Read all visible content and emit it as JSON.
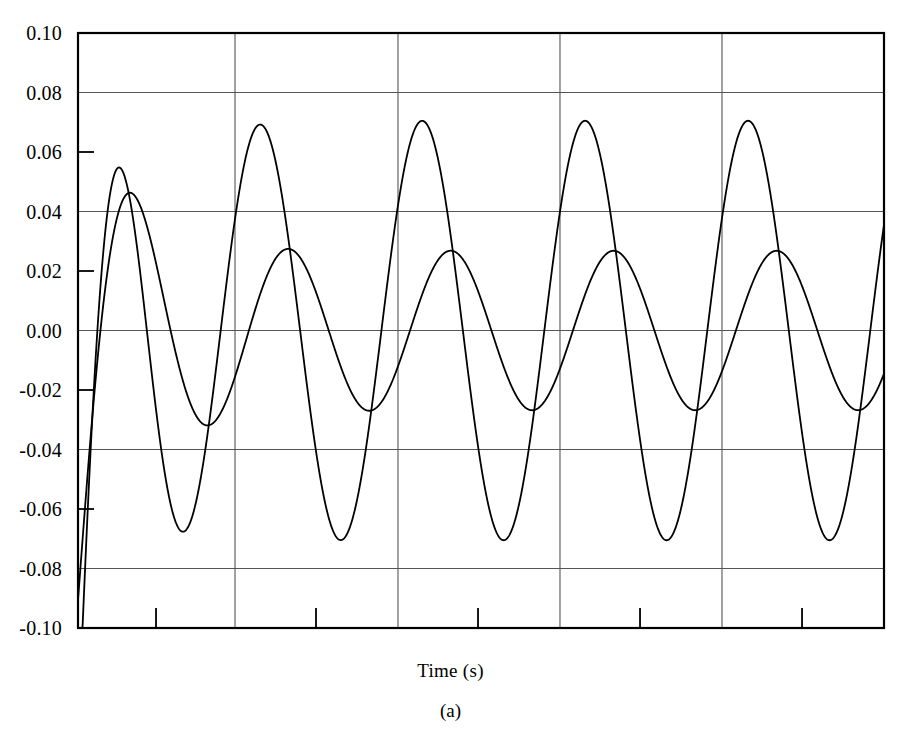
{
  "figure": {
    "caption": "(a)",
    "xaxis_title": "Time (s)"
  },
  "chart_data": {
    "type": "line",
    "title": "",
    "subtitle": "",
    "xlabel": "Time (s)",
    "ylabel": "",
    "caption": "(a)",
    "xlim": [
      0,
      0.5
    ],
    "ylim": [
      -0.1,
      0.1
    ],
    "grid": true,
    "grid_style": "major horizontal and vertical gridlines",
    "legend": "none",
    "y_major_ticks": [
      -0.1,
      -0.08,
      -0.06,
      -0.04,
      -0.02,
      0.0,
      0.02,
      0.04,
      0.06,
      0.08,
      0.1
    ],
    "y_tick_labels": [
      "-0.10",
      "-0.08",
      "-0.06",
      "-0.04",
      "-0.02",
      "0.00",
      "0.02",
      "0.04",
      "0.06",
      "0.08",
      "0.10"
    ],
    "y_gridline_values": [
      -0.08,
      -0.04,
      0.0,
      0.04,
      0.08
    ],
    "y_tickonly_values": [
      -0.06,
      -0.02,
      0.02,
      0.06
    ],
    "x_tick_labels": [],
    "x_gridline_fractions": [
      0.1948,
      0.397,
      0.598,
      0.799
    ],
    "x_minorticks_fractions": [
      0.0968,
      0.2953,
      0.4963,
      0.6973,
      0.8983
    ],
    "axis_color": "#000000",
    "grid_color": "#555555",
    "line_color": "#000000",
    "series": [
      {
        "name": "large-amplitude-response",
        "description": "decaying transient then steady sinusoid, amplitude approx 0.070",
        "steady_amplitude": 0.0705,
        "steady_offset": 0.0,
        "period_fraction": 0.1948,
        "initial_value": -0.095,
        "initial_peak": 0.079,
        "peak_values": [
          0.064,
          0.07,
          0.07,
          0.07,
          0.069
        ],
        "trough_values": [
          -0.069,
          -0.07,
          -0.07,
          -0.07
        ],
        "end_value": 0.04
      },
      {
        "name": "small-amplitude-response",
        "description": "decaying transient then steady sinusoid, amplitude approx 0.027",
        "steady_amplitude": 0.0268,
        "steady_offset": 0.0,
        "period_fraction": 0.1948,
        "initial_value": -0.095,
        "initial_peak": -0.024,
        "peak_values": [
          0.025,
          0.027,
          0.027,
          0.026,
          0.026
        ],
        "trough_values": [
          -0.0135,
          -0.028,
          -0.028,
          -0.027,
          -0.027
        ],
        "end_value": 0.015
      }
    ]
  }
}
